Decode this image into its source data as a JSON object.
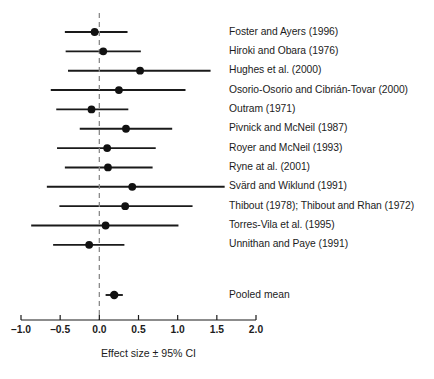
{
  "chart_data": {
    "type": "scatter",
    "subtype": "forest-plot",
    "title": "",
    "xlabel": "Effect size ± 95% CI",
    "ylabel": "",
    "xlim": [
      -1.0,
      2.0
    ],
    "xticks": [
      -1.0,
      -0.5,
      0.0,
      0.5,
      1.0,
      1.5,
      2.0
    ],
    "xtick_labels": [
      "–1.0",
      "–0.5",
      "0.0",
      "0.5",
      "1.0",
      "1.5",
      "2.0"
    ],
    "grid": false,
    "legend": "none",
    "reference_line": {
      "value": 0.0,
      "style": "dashed",
      "color": "#8a8a8a"
    },
    "marker_color": "#111111",
    "line_color": "#1a1a1a",
    "categories": [
      "Foster and Ayers (1996)",
      "Hiroki and Obara (1976)",
      "Hughes et al. (2000)",
      "Osorio-Osorio and Cibrián-Tovar (2000)",
      "Outram (1971)",
      "Pivnick and McNeil (1987)",
      "Royer and McNeil (1993)",
      "Ryne at al. (2001)",
      "Svärd and Wiklund (1991)",
      "Thibout (1978); Thibout and Rhan (1972)",
      "Torres-Vila et al. (1995)",
      "Unnithan and Paye (1991)"
    ],
    "points": [
      {
        "label": "Foster and Ayers (1996)",
        "effect": -0.06,
        "ci_low": -0.44,
        "ci_high": 0.36
      },
      {
        "label": "Hiroki and Obara (1976)",
        "effect": 0.05,
        "ci_low": -0.43,
        "ci_high": 0.53
      },
      {
        "label": "Hughes et al. (2000)",
        "effect": 0.52,
        "ci_low": -0.4,
        "ci_high": 1.42
      },
      {
        "label": "Osorio-Osorio and Cibrián-Tovar (2000)",
        "effect": 0.25,
        "ci_low": -0.62,
        "ci_high": 1.1
      },
      {
        "label": "Outram (1971)",
        "effect": -0.1,
        "ci_low": -0.55,
        "ci_high": 0.37
      },
      {
        "label": "Pivnick and McNeil (1987)",
        "effect": 0.34,
        "ci_low": -0.25,
        "ci_high": 0.93
      },
      {
        "label": "Royer and McNeil (1993)",
        "effect": 0.1,
        "ci_low": -0.54,
        "ci_high": 0.72
      },
      {
        "label": "Ryne at al. (2001)",
        "effect": 0.11,
        "ci_low": -0.44,
        "ci_high": 0.68
      },
      {
        "label": "Svärd and Wiklund (1991)",
        "effect": 0.42,
        "ci_low": -0.67,
        "ci_high": 1.6
      },
      {
        "label": "Thibout (1978); Thibout and Rhan (1972)",
        "effect": 0.33,
        "ci_low": -0.51,
        "ci_high": 1.19
      },
      {
        "label": "Torres-Vila et al. (1995)",
        "effect": 0.08,
        "ci_low": -0.87,
        "ci_high": 1.01
      },
      {
        "label": "Unnithan and Paye (1991)",
        "effect": -0.13,
        "ci_low": -0.59,
        "ci_high": 0.32
      }
    ],
    "pooled": {
      "label": "Pooled mean",
      "effect": 0.19,
      "ci_low": 0.08,
      "ci_high": 0.3
    }
  }
}
